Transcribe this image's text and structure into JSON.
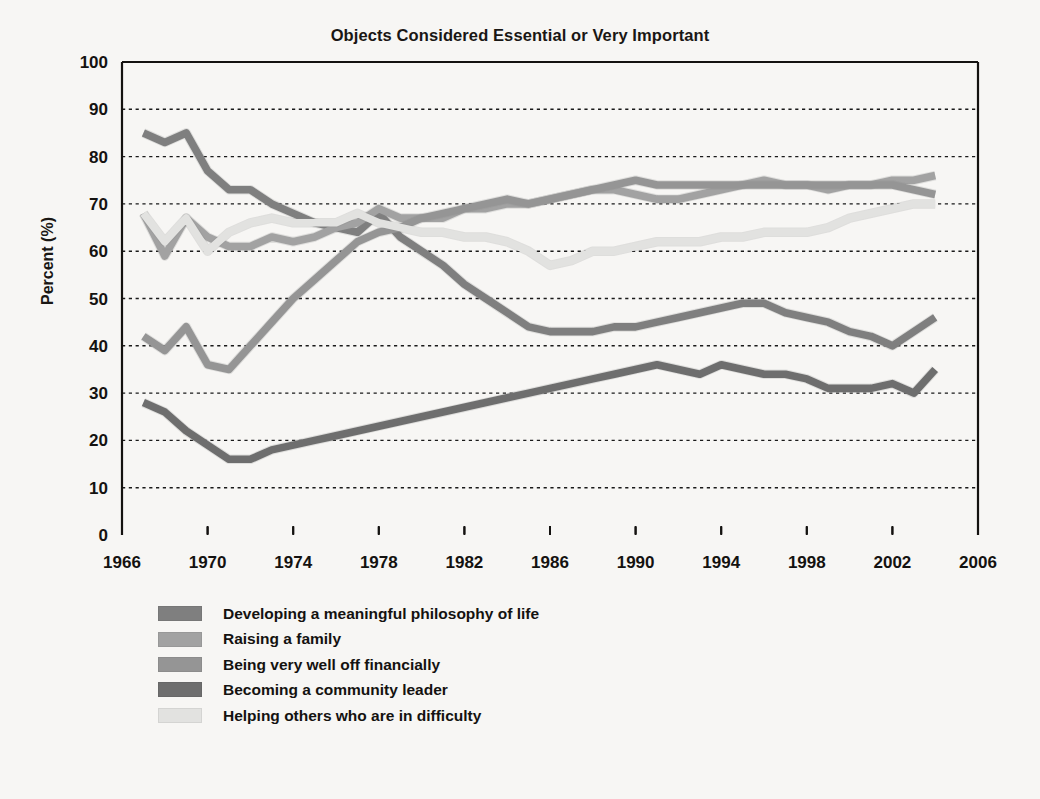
{
  "chart_data": {
    "type": "line",
    "title": "Objects Considered Essential or Very Important",
    "xlabel": "",
    "ylabel": "Percent (%)",
    "xlim": [
      1966,
      2006
    ],
    "ylim": [
      0,
      100
    ],
    "grid": true,
    "legend_position": "below-left",
    "xticks": [
      1966,
      1970,
      1974,
      1978,
      1982,
      1986,
      1990,
      1994,
      1998,
      2002,
      2006
    ],
    "yticks": [
      0,
      10,
      20,
      30,
      40,
      50,
      60,
      70,
      80,
      90,
      100
    ],
    "x": [
      1967,
      1968,
      1969,
      1970,
      1971,
      1972,
      1973,
      1974,
      1975,
      1976,
      1977,
      1978,
      1979,
      1980,
      1981,
      1982,
      1983,
      1984,
      1985,
      1986,
      1987,
      1988,
      1989,
      1990,
      1991,
      1992,
      1993,
      1994,
      1995,
      1996,
      1997,
      1998,
      1999,
      2000,
      2001,
      2002,
      2003,
      2004
    ],
    "series": [
      {
        "name": "Developing a meaningful philosophy of life",
        "color": "#7f7f7f",
        "values": [
          85,
          83,
          85,
          77,
          73,
          73,
          70,
          68,
          66,
          65,
          64,
          68,
          63,
          60,
          57,
          53,
          50,
          47,
          44,
          43,
          43,
          43,
          44,
          44,
          45,
          46,
          47,
          48,
          49,
          49,
          47,
          46,
          45,
          43,
          42,
          40,
          43,
          46
        ]
      },
      {
        "name": "Raising a family",
        "color": "#a2a2a2",
        "values": [
          68,
          59,
          67,
          63,
          61,
          61,
          63,
          62,
          63,
          65,
          66,
          69,
          67,
          67,
          67,
          69,
          69,
          70,
          70,
          71,
          72,
          73,
          73,
          72,
          71,
          71,
          72,
          73,
          74,
          75,
          74,
          74,
          73,
          74,
          74,
          75,
          75,
          76
        ]
      },
      {
        "name": "Being very well off financially",
        "color": "#959595",
        "values": [
          42,
          39,
          44,
          36,
          35,
          40,
          45,
          50,
          54,
          58,
          62,
          64,
          65,
          67,
          68,
          69,
          70,
          71,
          70,
          71,
          72,
          73,
          74,
          75,
          74,
          74,
          74,
          74,
          74,
          74,
          74,
          74,
          74,
          74,
          74,
          74,
          73,
          72
        ]
      },
      {
        "name": "Becoming a community leader",
        "color": "#6e6e6e",
        "values": [
          28,
          26,
          22,
          19,
          16,
          16,
          18,
          19,
          20,
          21,
          22,
          23,
          24,
          25,
          26,
          27,
          28,
          29,
          30,
          31,
          32,
          33,
          34,
          35,
          36,
          35,
          34,
          36,
          35,
          34,
          34,
          33,
          31,
          31,
          31,
          32,
          30,
          35
        ]
      },
      {
        "name": "Helping others who are in difficulty",
        "color": "#e2e2e0",
        "values": [
          68,
          62,
          67,
          60,
          64,
          66,
          67,
          66,
          66,
          66,
          68,
          66,
          65,
          64,
          64,
          63,
          63,
          62,
          60,
          57,
          58,
          60,
          60,
          61,
          62,
          62,
          62,
          63,
          63,
          64,
          64,
          64,
          65,
          67,
          68,
          69,
          70,
          70
        ]
      }
    ]
  },
  "legend": {
    "items": [
      {
        "label": "Developing a meaningful philosophy of life",
        "color": "#7f7f7f"
      },
      {
        "label": "Raising a family",
        "color": "#a2a2a2"
      },
      {
        "label": "Being very well off financially",
        "color": "#959595"
      },
      {
        "label": "Becoming a community leader",
        "color": "#6e6e6e"
      },
      {
        "label": "Helping others who are in difficulty",
        "color": "#e2e2e0"
      }
    ]
  },
  "axes": {
    "y_title": "Percent (%)"
  },
  "style": {
    "background": "#f7f6f4",
    "axis_color": "#141210",
    "grid_color": "#1a1a1a"
  }
}
